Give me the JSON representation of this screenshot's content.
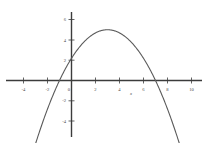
{
  "chart_data": {
    "type": "line",
    "title": "",
    "xlabel": "x",
    "ylabel": "",
    "grid": false,
    "legend": false,
    "xlim": [
      -5.2,
      10.8
    ],
    "ylim": [
      -5.6,
      6.6
    ],
    "xticks": [
      -4,
      -2,
      0,
      2,
      4,
      6,
      8,
      10
    ],
    "xtick_labels": [
      "-4",
      "-2",
      "0",
      "2",
      "4",
      "6",
      "8",
      "10"
    ],
    "yticks": [
      6,
      4,
      2,
      -2,
      -4
    ],
    "ytick_labels": [
      "6",
      "4",
      "2",
      "-2",
      "-4"
    ],
    "series": [
      {
        "name": "parabola",
        "equation": "y = -0.5(x+1)(x-7)",
        "color": "#555555",
        "vertex": [
          3,
          5
        ],
        "roots": [
          -1,
          7
        ],
        "y_intercept": 3.5,
        "x": [
          -2.4,
          -2.0,
          -1.5,
          -1.0,
          -0.5,
          0.0,
          0.5,
          1.0,
          1.5,
          2.0,
          2.5,
          3.0,
          3.5,
          4.0,
          4.5,
          5.0,
          5.5,
          6.0,
          6.5,
          7.0,
          7.5,
          8.0,
          8.5,
          9.0,
          9.4
        ],
        "y": [
          -5.3,
          -4.5,
          -3.1,
          -2.0,
          -1.1,
          3.5,
          4.1,
          5.0,
          4.9,
          4.5,
          4.9,
          5.0,
          4.9,
          4.5,
          4.1,
          3.0,
          2.1,
          1.0,
          -0.4,
          0.0,
          -1.3,
          -2.5,
          -3.9,
          -5.0,
          -5.6
        ]
      }
    ],
    "axis_color": "#3c3c3c",
    "curve_color": "#5a5a5a"
  },
  "axes": {
    "x_axis_name": "x-axis",
    "y_axis_name": "y-axis",
    "x_label_text": "x"
  }
}
